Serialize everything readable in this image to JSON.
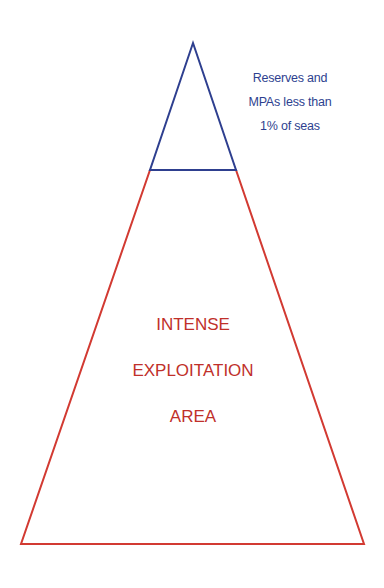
{
  "colors": {
    "top_triangle": "#2e3f8f",
    "bottom_trapezoid": "#d23a32",
    "top_text": "#2e3f8f",
    "bottom_text": "#c0302a",
    "background": "#ffffff"
  },
  "top_section": {
    "label_lines": [
      "Reserves and",
      "MPAs less than",
      "1% of seas"
    ]
  },
  "bottom_section": {
    "label_lines": [
      "INTENSE",
      "EXPLOITATION",
      "AREA"
    ]
  }
}
